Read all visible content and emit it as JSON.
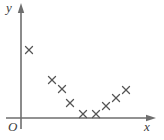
{
  "figure": {
    "kind": "scatter-plot",
    "width": 164,
    "height": 140,
    "background_color": "#ffffff"
  },
  "axes": {
    "y_label": "y",
    "x_label": "x",
    "origin_label": "O",
    "axis_color": "#6e6e6e",
    "axis_line_width": 1.6,
    "y_axis_x": 21,
    "x_axis_y": 118,
    "y_axis_top": 6,
    "y_axis_bottom": 129,
    "x_axis_left": 6,
    "x_axis_right": 153,
    "arrowheads": [
      "y-axis-up-arrow",
      "x-axis-right-arrow"
    ]
  },
  "markers": {
    "shape": "x-cross",
    "color": "#555555",
    "size": 7,
    "stroke_width": 1.3
  },
  "chart_data": {
    "type": "scatter",
    "title": "",
    "xlabel": "x",
    "ylabel": "y",
    "grid": false,
    "legend": null,
    "axis_ticks": [],
    "xlim": [
      0,
      153
    ],
    "ylim": [
      0,
      118
    ],
    "note": "Pixel coordinates of plotted crosses, measured from the figure's origin at (21,118); x to the right, y upward.",
    "points_px": [
      {
        "cx": 29,
        "cy": 50
      },
      {
        "cx": 52,
        "cy": 80
      },
      {
        "cx": 62,
        "cy": 89
      },
      {
        "cx": 70,
        "cy": 103
      },
      {
        "cx": 83,
        "cy": 114
      },
      {
        "cx": 96,
        "cy": 114
      },
      {
        "cx": 106,
        "cy": 106
      },
      {
        "cx": 116,
        "cy": 98
      },
      {
        "cx": 126,
        "cy": 90
      }
    ],
    "x": [
      8,
      31,
      41,
      49,
      62,
      75,
      85,
      95,
      105
    ],
    "y": [
      68,
      38,
      29,
      15,
      4,
      4,
      12,
      20,
      28
    ]
  }
}
